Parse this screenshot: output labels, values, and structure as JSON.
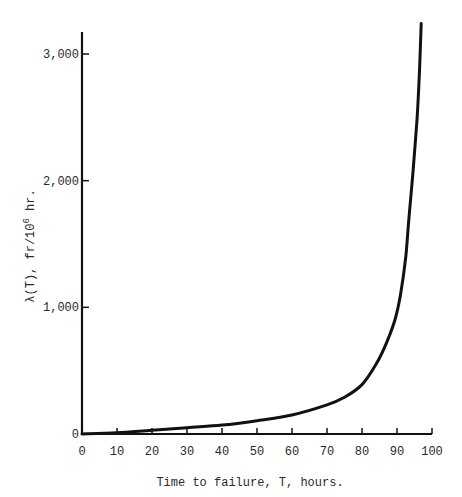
{
  "chart_data": {
    "type": "line",
    "title": "",
    "xlabel": "Time to failure, T, hours.",
    "ylabel": "λ(T), fr/10⁶ hr.",
    "ylabel_parts": {
      "main": "λ(T),  fr/10",
      "sup": "6",
      "tail": " hr."
    },
    "xlim": [
      0,
      100
    ],
    "ylim": [
      0,
      3000
    ],
    "xticks": [
      0,
      10,
      20,
      30,
      40,
      50,
      60,
      70,
      80,
      90,
      100
    ],
    "xtick_labels": [
      "0",
      "10",
      "20",
      "30",
      "40",
      "50",
      "60",
      "70",
      "80",
      "90",
      "100"
    ],
    "yticks": [
      0,
      1000,
      2000,
      3000
    ],
    "ytick_labels": [
      "0",
      "1,000",
      "2,000",
      "3,000"
    ],
    "grid": false,
    "legend": null,
    "series": [
      {
        "name": "λ(T)",
        "color": "#111111",
        "x": [
          0,
          10,
          20,
          30,
          40,
          50,
          60,
          70,
          75,
          80,
          84,
          87,
          89.4,
          91,
          92.5,
          93.4,
          94.5,
          95.7,
          96.4,
          96.9
        ],
        "y": [
          0,
          10,
          30,
          50,
          70,
          105,
          150,
          230,
          290,
          390,
          550,
          720,
          900,
          1100,
          1400,
          1700,
          2050,
          2480,
          2850,
          3240
        ]
      }
    ]
  }
}
